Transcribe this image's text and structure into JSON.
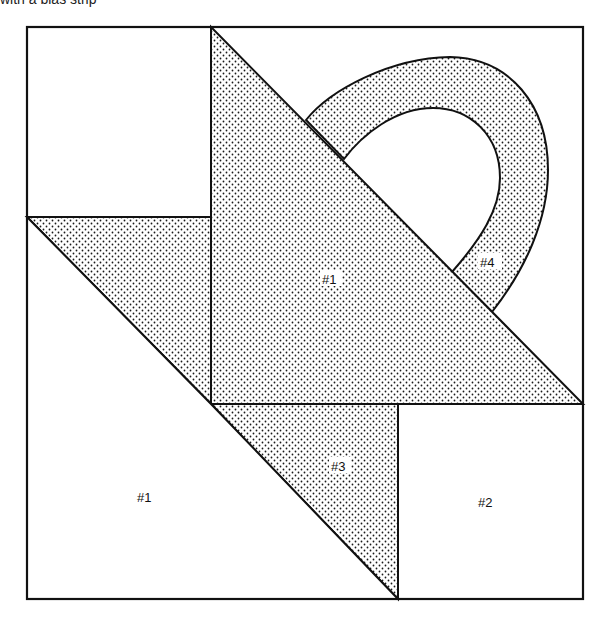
{
  "caption": "with a bias strip",
  "diagram": {
    "colors": {
      "line": "#111111",
      "background": "#ffffff",
      "stipple": "#1a1a1a"
    },
    "labels": {
      "center_piece": "#1",
      "bottom_left_piece": "#1",
      "right_square": "#2",
      "small_triangle": "#3",
      "handle": "#4"
    },
    "pieces": [
      {
        "id": "top-left-square",
        "fill": "plain"
      },
      {
        "id": "large-triangle",
        "label": "#1",
        "fill": "stippled"
      },
      {
        "id": "left-triangle",
        "fill": "stippled"
      },
      {
        "id": "bottom-left-triangle",
        "label": "#1",
        "fill": "plain"
      },
      {
        "id": "small-triangle",
        "label": "#3",
        "fill": "stippled"
      },
      {
        "id": "bottom-right-square",
        "label": "#2",
        "fill": "plain"
      },
      {
        "id": "handle-strip",
        "label": "#4",
        "fill": "stippled"
      }
    ]
  }
}
